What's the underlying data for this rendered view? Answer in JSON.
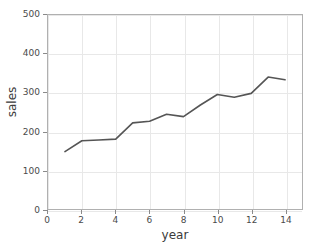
{
  "chart_data": {
    "type": "line",
    "title": "",
    "xlabel": "year",
    "ylabel": "sales",
    "xlim": [
      0,
      15
    ],
    "ylim": [
      0,
      500
    ],
    "grid": true,
    "legend": false,
    "x": [
      1,
      2,
      3,
      4,
      5,
      6,
      7,
      8,
      9,
      10,
      11,
      12,
      13,
      14
    ],
    "values": [
      148,
      176,
      178,
      180,
      222,
      226,
      244,
      238,
      268,
      295,
      288,
      298,
      340,
      333
    ],
    "series": [
      {
        "name": "sales",
        "color": "#555555",
        "values": [
          148,
          176,
          178,
          180,
          222,
          226,
          244,
          238,
          268,
          295,
          288,
          298,
          340,
          333
        ]
      }
    ],
    "xticks": [
      0,
      2,
      4,
      6,
      8,
      10,
      12,
      14
    ],
    "xtick_labels": [
      "0",
      "2",
      "4",
      "6",
      "8",
      "10",
      "12",
      "14"
    ],
    "yticks": [
      0,
      100,
      200,
      300,
      400,
      500
    ],
    "ytick_labels": [
      "0",
      "100",
      "200",
      "300",
      "400",
      "500"
    ]
  },
  "style": {
    "line_color": "#555555",
    "grid_color": "#e8e8e8",
    "frame_color": "#b0b0b0",
    "tick_color": "#8a8a8a",
    "text_color": "#3a3a3a",
    "background": "#ffffff"
  }
}
